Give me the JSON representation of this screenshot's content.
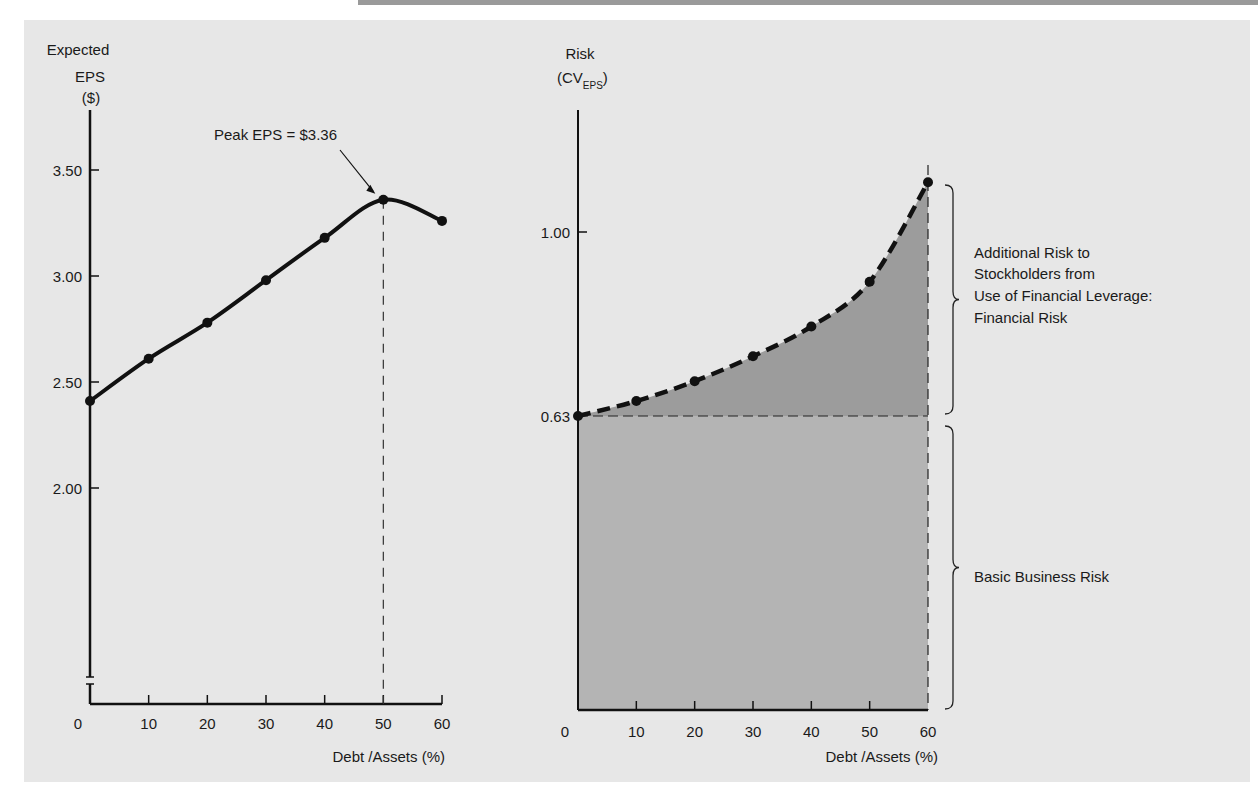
{
  "chart_data": [
    {
      "type": "line",
      "title": "",
      "ylabel_lines": [
        "Expected",
        "EPS",
        "($)"
      ],
      "xlabel": "Debt /Assets (%)",
      "x": [
        0,
        10,
        20,
        30,
        40,
        50,
        60
      ],
      "series": [
        {
          "name": "Expected EPS",
          "values": [
            2.41,
            2.61,
            2.78,
            2.98,
            3.18,
            3.36,
            3.26
          ]
        }
      ],
      "xlim": [
        0,
        60
      ],
      "ylim": [
        1.5,
        3.7
      ],
      "yticks": [
        2.0,
        2.5,
        3.0,
        3.5
      ],
      "ytick_labels": [
        "2.00",
        "2.50",
        "3.00",
        "3.50"
      ],
      "xticks": [
        0,
        10,
        20,
        30,
        40,
        50,
        60
      ],
      "xtick_labels": [
        "0",
        "10",
        "20",
        "30",
        "40",
        "50",
        "60"
      ],
      "axis_break": true,
      "grid": false,
      "annotations": [
        {
          "text": "Peak EPS = $3.36",
          "x": 50,
          "y": 3.36,
          "arrow": true
        }
      ],
      "reference_lines": [
        {
          "orientation": "vertical",
          "x": 50,
          "style": "dashed"
        }
      ]
    },
    {
      "type": "area",
      "title": "",
      "ylabel": "Risk",
      "ylabel_paren": "(CV",
      "ylabel_sub": "EPS",
      "ylabel_close": ")",
      "xlabel": "Debt /Assets (%)",
      "x": [
        0,
        10,
        20,
        30,
        40,
        50,
        60
      ],
      "series": [
        {
          "name": "Risk (CV EPS)",
          "style": "dashed",
          "values": [
            0.63,
            0.66,
            0.7,
            0.75,
            0.81,
            0.9,
            1.1
          ]
        }
      ],
      "xlim": [
        0,
        60
      ],
      "ylim": [
        0,
        1.2
      ],
      "yticks": [
        0.63,
        1.0
      ],
      "ytick_labels": [
        "0.63",
        "1.00"
      ],
      "xticks": [
        0,
        10,
        20,
        30,
        40,
        50,
        60
      ],
      "xtick_labels": [
        "0",
        "10",
        "20",
        "30",
        "40",
        "50",
        "60"
      ],
      "grid": false,
      "regions": [
        {
          "name": "Basic Business Risk",
          "from": 0,
          "to": 0.63,
          "label_lines": [
            "Basic Business Risk"
          ]
        },
        {
          "name": "Financial Risk",
          "from": 0.63,
          "to": "curve",
          "label_lines": [
            "Additional Risk to",
            "Stockholders from",
            "Use of Financial Leverage:",
            "Financial Risk"
          ]
        }
      ],
      "colors": {
        "financial_risk_fill": "#9c9c9c",
        "business_risk_fill": "#b4b4b4"
      }
    }
  ]
}
